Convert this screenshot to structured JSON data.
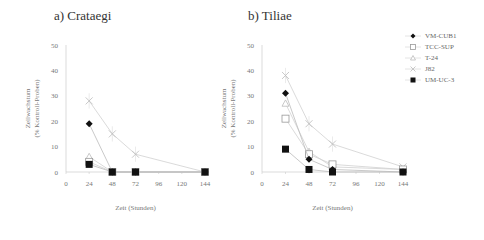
{
  "chart_data": [
    {
      "type": "line",
      "title": "a) Crataegi",
      "xlabel": "Zeit (Stunden)",
      "ylabel": "Zellwachstum (% Kontroll-Proben)",
      "x": [
        24,
        48,
        72,
        144
      ],
      "xticks": [
        0,
        24,
        48,
        72,
        96,
        120,
        144
      ],
      "yticks": [
        0,
        10,
        20,
        30,
        40,
        50
      ],
      "ylim": [
        0,
        50
      ],
      "series": [
        {
          "name": "VM-CUB1",
          "values": [
            19,
            0,
            0,
            0
          ]
        },
        {
          "name": "TCC-SUP",
          "values": [
            4,
            0,
            0,
            0
          ]
        },
        {
          "name": "T-24",
          "values": [
            6,
            0,
            0,
            0
          ]
        },
        {
          "name": "J82",
          "values": [
            28,
            15,
            7,
            0
          ]
        },
        {
          "name": "UM-UC-3",
          "values": [
            3,
            0,
            0,
            0
          ]
        }
      ]
    },
    {
      "type": "line",
      "title": "b) Tiliae",
      "xlabel": "Zeit (Stunden)",
      "ylabel": "Zellwachstum (% Kontroll-Proben)",
      "x": [
        24,
        48,
        72,
        144
      ],
      "xticks": [
        0,
        24,
        48,
        72,
        96,
        120,
        144
      ],
      "yticks": [
        0,
        10,
        20,
        30,
        40,
        50
      ],
      "ylim": [
        0,
        50
      ],
      "series": [
        {
          "name": "VM-CUB1",
          "values": [
            31,
            5,
            1,
            0
          ]
        },
        {
          "name": "TCC-SUP",
          "values": [
            21,
            7,
            3,
            1
          ]
        },
        {
          "name": "T-24",
          "values": [
            27,
            8,
            2,
            1
          ]
        },
        {
          "name": "J82",
          "values": [
            38,
            19,
            11,
            2
          ]
        },
        {
          "name": "UM-UC-3",
          "values": [
            9,
            1,
            0,
            0
          ]
        }
      ]
    }
  ],
  "panels": {
    "a": {
      "title": "a) Crataegi"
    },
    "b": {
      "title": "b) Tiliae"
    }
  },
  "legend": [
    {
      "label": "VM-CUB1",
      "marker": "diamond-filled"
    },
    {
      "label": "TCC-SUP",
      "marker": "square-open"
    },
    {
      "label": "T-24",
      "marker": "triangle-open"
    },
    {
      "label": "J82",
      "marker": "x-cross"
    },
    {
      "label": "UM-UC-3",
      "marker": "square-filled"
    }
  ]
}
